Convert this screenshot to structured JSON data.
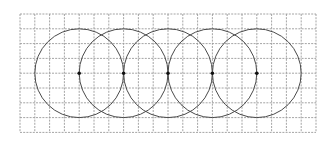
{
  "figure": {
    "grid": {
      "columns": 20,
      "rows": 8,
      "line_style": "dashed",
      "line_color": "#9a9a9a"
    },
    "circles": [
      {
        "center": [
          4,
          4
        ],
        "radius": 3
      },
      {
        "center": [
          7,
          4
        ],
        "radius": 3
      },
      {
        "center": [
          10,
          4
        ],
        "radius": 3
      },
      {
        "center": [
          13,
          4
        ],
        "radius": 3
      },
      {
        "center": [
          16,
          4
        ],
        "radius": 3
      }
    ],
    "circle_color": "#4a4a4a",
    "center_dot_color": "#111111",
    "background_color": "#ffffff"
  }
}
